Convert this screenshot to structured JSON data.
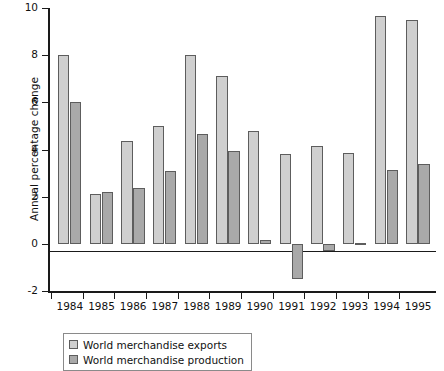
{
  "chart_data": {
    "type": "bar",
    "title": "",
    "xlabel": "",
    "ylabel": "Annual percentage change",
    "ylim": [
      -2,
      10
    ],
    "yticks": [
      -2,
      0,
      2,
      4,
      6,
      8,
      10
    ],
    "ytick_labels": [
      "-2",
      "0",
      "2",
      "4",
      "6",
      "8",
      "10"
    ],
    "grid": false,
    "legend_position": "bottom-left",
    "categories": [
      "1984",
      "1985",
      "1986",
      "1987",
      "1988",
      "1989",
      "1990",
      "1991",
      "1992",
      "1993",
      "1994",
      "1995"
    ],
    "series": [
      {
        "name": "World merchandise exports",
        "color": "#cfcfcf",
        "values": [
          8.0,
          2.1,
          4.35,
          5.0,
          8.0,
          7.1,
          4.8,
          3.8,
          4.15,
          3.85,
          9.65,
          9.5
        ]
      },
      {
        "name": "World merchandise production",
        "color": "#a9a9a9",
        "values": [
          6.0,
          2.2,
          2.35,
          3.1,
          4.65,
          3.95,
          0.15,
          -1.5,
          -0.3,
          0.05,
          3.15,
          3.4
        ]
      }
    ]
  },
  "legend": {
    "items": [
      {
        "label": "World merchandise exports",
        "key": "exports"
      },
      {
        "label": "World merchandise production",
        "key": "production"
      }
    ]
  }
}
